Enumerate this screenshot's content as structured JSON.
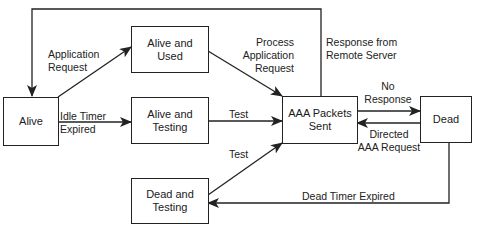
{
  "diagram": {
    "type": "state-transition",
    "states": {
      "alive": "Alive",
      "alive_used": "Alive and\nUsed",
      "alive_testing": "Alive and\nTesting",
      "aaa_sent": "AAA Packets\nSent",
      "dead": "Dead",
      "dead_testing": "Dead and\nTesting"
    },
    "transitions": {
      "application_request": "Application\nRequest",
      "idle_timer_expired": "Idle Timer\nExpired",
      "process_application_request": "Process\nApplication\nRequest",
      "response_from_remote_server": "Response from\nRemote Server",
      "test_from_alive_testing": "Test",
      "test_from_dead_testing": "Test",
      "no_response": "No\nResponse",
      "directed_aaa_request": "Directed\nAAA Request",
      "dead_timer_expired": "Dead Timer Expired"
    },
    "edges": [
      {
        "from": "alive",
        "to": "alive_used",
        "label": "application_request"
      },
      {
        "from": "alive",
        "to": "alive_testing",
        "label": "idle_timer_expired"
      },
      {
        "from": "alive_used",
        "to": "aaa_sent",
        "label": "process_application_request"
      },
      {
        "from": "alive_testing",
        "to": "aaa_sent",
        "label": "test_from_alive_testing"
      },
      {
        "from": "dead_testing",
        "to": "aaa_sent",
        "label": "test_from_dead_testing"
      },
      {
        "from": "aaa_sent",
        "to": "alive",
        "label": "response_from_remote_server"
      },
      {
        "from": "aaa_sent",
        "to": "dead",
        "label": "no_response"
      },
      {
        "from": "dead",
        "to": "aaa_sent",
        "label": "directed_aaa_request"
      },
      {
        "from": "dead",
        "to": "dead_testing",
        "label": "dead_timer_expired"
      }
    ],
    "colors": {
      "line": "#222222",
      "background": "#ffffff"
    }
  }
}
